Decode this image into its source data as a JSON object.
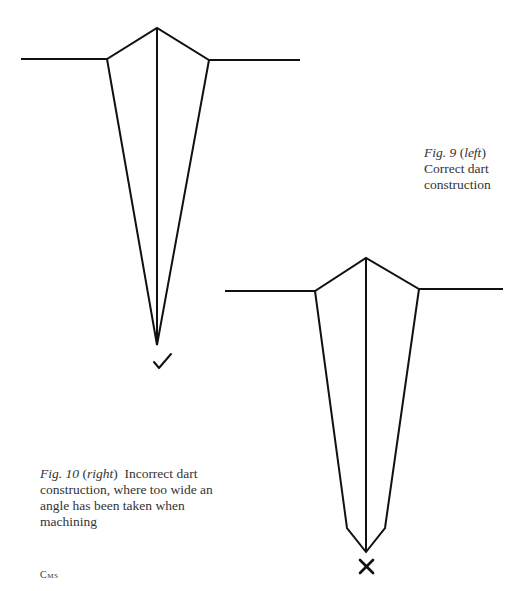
{
  "figures": [
    {
      "id": "fig9",
      "label": "Fig. 9",
      "qualifier": "left",
      "caption": "Correct dart construction",
      "mark": "✓",
      "mark_meaning": "correct",
      "geometry": {
        "left_edge": [
          [
            21,
            59
          ],
          [
            107,
            59
          ]
        ],
        "apex": [
          157,
          28
        ],
        "right_edge": [
          [
            209,
            60
          ],
          [
            300,
            60
          ]
        ],
        "point": [
          157,
          345
        ]
      }
    },
    {
      "id": "fig10",
      "label": "Fig. 10",
      "qualifier": "right",
      "caption": "Incorrect dart construction, where too wide an angle has been taken when machining",
      "mark": "✕",
      "mark_meaning": "incorrect",
      "geometry": {
        "left_edge": [
          [
            225,
            291
          ],
          [
            315,
            291
          ]
        ],
        "apex": [
          366,
          258
        ],
        "right_edge": [
          [
            419,
            289
          ],
          [
            503,
            289
          ]
        ],
        "lower_kinks": [
          [
            347,
            528
          ],
          [
            385,
            528
          ]
        ],
        "point": [
          366,
          552
        ]
      }
    }
  ],
  "cap9": {
    "label": "Fig. 9",
    "qual": "left",
    "text": "Correct dart construction"
  },
  "cap10": {
    "label": "Fig. 10",
    "qual": "right",
    "text": "Incorrect dart construction, where too wide an angle has been taken when machining"
  },
  "credit": "Cms",
  "colors": {
    "line": "#111111",
    "text": "#333333",
    "background": "#ffffff"
  }
}
